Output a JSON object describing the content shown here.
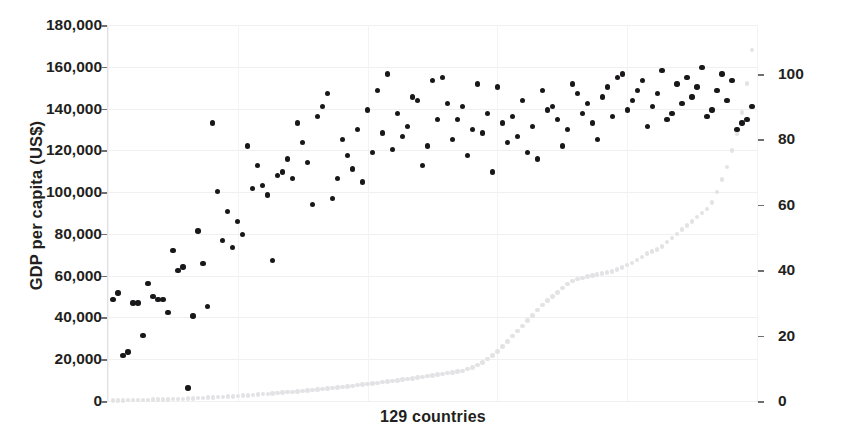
{
  "chart_data": {
    "type": "scatter",
    "title": "",
    "xlabel": "129 countries",
    "ylabel": "GDP per capita (US$)",
    "y2label": "Female secondary school enrollment",
    "grid": true,
    "legend_position": "none",
    "xlim": [
      0,
      130
    ],
    "ylim": [
      0,
      180000
    ],
    "y2lim": [
      0,
      115
    ],
    "ytick_labels": [
      "180,000",
      "160,000",
      "140,000",
      "120,000",
      "100,000",
      "80,000",
      "60,000",
      "40,000",
      "20,000",
      "0"
    ],
    "ytick_values": [
      180000,
      160000,
      140000,
      120000,
      100000,
      80000,
      60000,
      40000,
      20000,
      0
    ],
    "y2tick_labels": [
      "100",
      "80",
      "60",
      "40",
      "20",
      "0"
    ],
    "y2tick_values": [
      100,
      80,
      60,
      40,
      20,
      0
    ],
    "series": [
      {
        "name": "Female secondary school enrollment",
        "axis": "right",
        "color": "#19171a",
        "marker": "circle",
        "x": [
          1,
          2,
          3,
          4,
          5,
          6,
          7,
          8,
          9,
          10,
          11,
          12,
          13,
          14,
          15,
          16,
          17,
          18,
          19,
          20,
          21,
          22,
          23,
          24,
          25,
          26,
          27,
          28,
          29,
          30,
          31,
          32,
          33,
          34,
          35,
          36,
          37,
          38,
          39,
          40,
          41,
          42,
          43,
          44,
          45,
          46,
          47,
          48,
          49,
          50,
          51,
          52,
          53,
          54,
          55,
          56,
          57,
          58,
          59,
          60,
          61,
          62,
          63,
          64,
          65,
          66,
          67,
          68,
          69,
          70,
          71,
          72,
          73,
          74,
          75,
          76,
          77,
          78,
          79,
          80,
          81,
          82,
          83,
          84,
          85,
          86,
          87,
          88,
          89,
          90,
          91,
          92,
          93,
          94,
          95,
          96,
          97,
          98,
          99,
          100,
          101,
          102,
          103,
          104,
          105,
          106,
          107,
          108,
          109,
          110,
          111,
          112,
          113,
          114,
          115,
          116,
          117,
          118,
          119,
          120,
          121,
          122,
          123,
          124,
          125,
          126,
          127,
          128,
          129
        ],
        "values": [
          31,
          33,
          14,
          15,
          30,
          30,
          20,
          36,
          32,
          31,
          31,
          27,
          46,
          40,
          41,
          4,
          26,
          52,
          42,
          29,
          85,
          64,
          49,
          58,
          47,
          55,
          51,
          78,
          65,
          72,
          66,
          63,
          43,
          69,
          70,
          74,
          68,
          85,
          79,
          73,
          60,
          87,
          90,
          94,
          62,
          68,
          80,
          75,
          71,
          83,
          67,
          89,
          76,
          95,
          82,
          100,
          77,
          88,
          81,
          84,
          93,
          92,
          72,
          78,
          98,
          86,
          99,
          91,
          80,
          86,
          90,
          75,
          83,
          97,
          82,
          88,
          70,
          96,
          85,
          79,
          87,
          81,
          92,
          76,
          84,
          74,
          95,
          89,
          90,
          86,
          78,
          83,
          97,
          94,
          88,
          91,
          85,
          80,
          93,
          96,
          87,
          99,
          100,
          89,
          92,
          95,
          98,
          84,
          90,
          94,
          101,
          86,
          88,
          97,
          91,
          99,
          93,
          96,
          102,
          87,
          89,
          95,
          100,
          92,
          98,
          83,
          85,
          86,
          90
        ]
      },
      {
        "name": "GDP per capita (US$)",
        "axis": "left",
        "color": "#e3e3e5",
        "marker": "circle",
        "x": [
          1,
          2,
          3,
          4,
          5,
          6,
          7,
          8,
          9,
          10,
          11,
          12,
          13,
          14,
          15,
          16,
          17,
          18,
          19,
          20,
          21,
          22,
          23,
          24,
          25,
          26,
          27,
          28,
          29,
          30,
          31,
          32,
          33,
          34,
          35,
          36,
          37,
          38,
          39,
          40,
          41,
          42,
          43,
          44,
          45,
          46,
          47,
          48,
          49,
          50,
          51,
          52,
          53,
          54,
          55,
          56,
          57,
          58,
          59,
          60,
          61,
          62,
          63,
          64,
          65,
          66,
          67,
          68,
          69,
          70,
          71,
          72,
          73,
          74,
          75,
          76,
          77,
          78,
          79,
          80,
          81,
          82,
          83,
          84,
          85,
          86,
          87,
          88,
          89,
          90,
          91,
          92,
          93,
          94,
          95,
          96,
          97,
          98,
          99,
          100,
          101,
          102,
          103,
          104,
          105,
          106,
          107,
          108,
          109,
          110,
          111,
          112,
          113,
          114,
          115,
          116,
          117,
          118,
          119,
          120,
          121,
          122,
          123,
          124,
          125,
          126,
          127,
          128,
          129
        ],
        "values": [
          260,
          300,
          340,
          390,
          430,
          480,
          520,
          580,
          640,
          700,
          760,
          830,
          900,
          980,
          1050,
          1150,
          1250,
          1350,
          1460,
          1580,
          1700,
          1830,
          1960,
          2100,
          2250,
          2400,
          2560,
          2720,
          2890,
          3060,
          3240,
          3420,
          3610,
          3800,
          4000,
          4200,
          4410,
          4620,
          4840,
          5060,
          5290,
          5520,
          5760,
          6000,
          6250,
          6500,
          6760,
          7020,
          7290,
          7560,
          7840,
          8120,
          8410,
          8700,
          9000,
          9300,
          9610,
          9920,
          10240,
          10560,
          10890,
          11220,
          11560,
          11900,
          12250,
          12600,
          12960,
          13320,
          13690,
          14060,
          14440,
          15200,
          16100,
          17200,
          18500,
          20000,
          21800,
          23800,
          26000,
          28500,
          31000,
          33500,
          36000,
          38500,
          41000,
          43500,
          46000,
          48000,
          50000,
          52000,
          54000,
          56000,
          57500,
          58500,
          59000,
          59500,
          60000,
          60500,
          61000,
          61500,
          62000,
          63000,
          64000,
          65000,
          66000,
          67500,
          69000,
          70500,
          71500,
          72500,
          74000,
          76000,
          78000,
          80000,
          82000,
          84000,
          86000,
          88000,
          90000,
          92000,
          95000,
          100000,
          106000,
          112000,
          120000,
          128000,
          138000,
          152000,
          168000
        ]
      }
    ]
  },
  "axes": {
    "left_title": "GDP per capita (US$)",
    "right_title": "Female secondary school enrollment",
    "x_title": "129 countries"
  }
}
